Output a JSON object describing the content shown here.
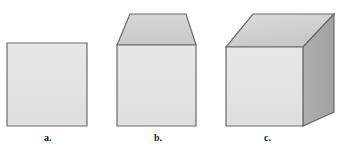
{
  "figure": {
    "background_color": "#ffffff",
    "width": 348,
    "height": 152,
    "outline_color": "#6b6b6b",
    "outline_width": 1.2
  },
  "palette": {
    "front_face": "#e4e4e2",
    "front_face_edge": "#dcdcda",
    "top_face": "#cfcfcd",
    "top_face_light": "#dcdcda",
    "right_face": "#a9a9a7",
    "right_face_dark": "#9e9e9c",
    "outline": "#6b6b6b",
    "label_color": "#1a1a1a"
  },
  "shapes": [
    {
      "id": "shape-a",
      "label": "a.",
      "kind": "square",
      "description": "Flat square (2D) with light gray fill",
      "faces": {
        "front": {
          "name": "front-face",
          "points": "7,43 87,43 87,126 7,126",
          "fill": "#e4e4e2"
        }
      },
      "label_position": {
        "x": 44,
        "y": 133
      }
    },
    {
      "id": "shape-b",
      "label": "b.",
      "kind": "square-with-top-face",
      "description": "Square front face with a trapezoidal top face giving partial depth",
      "faces": {
        "front": {
          "name": "front-face",
          "points": "117,45 196,45 196,126 117,126",
          "fill": "#e4e4e2"
        },
        "top": {
          "name": "top-face",
          "points": "130,14 186,14 196,45 117,45",
          "fill": "#cfcfcd"
        }
      },
      "label_position": {
        "x": 154,
        "y": 133
      }
    },
    {
      "id": "shape-c",
      "label": "c.",
      "kind": "cube",
      "description": "Full cube in oblique projection with front, top and right faces",
      "faces": {
        "front": {
          "name": "front-face",
          "points": "226,47 303,47 303,126 226,126",
          "fill": "#e4e4e2"
        },
        "top": {
          "name": "top-face",
          "points": "253,14 334,14 303,47 226,47",
          "fill": "#cfcfcd"
        },
        "right": {
          "name": "right-face",
          "points": "303,47 334,14 334,112 303,126",
          "fill": "#a9a9a7"
        }
      },
      "label_position": {
        "x": 264,
        "y": 133
      }
    }
  ]
}
